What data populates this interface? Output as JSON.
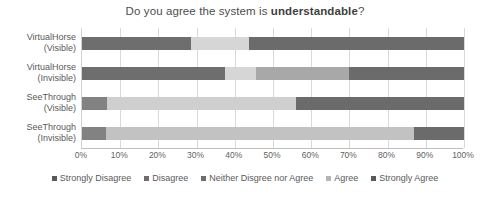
{
  "chart_data": {
    "type": "bar",
    "orientation": "horizontal",
    "stacked": true,
    "normalized": true,
    "title": "Do you agree the system is understandable?",
    "title_plain": "Do you agree the system is ",
    "title_bold": "understandable",
    "title_suffix": "?",
    "xlabel": "",
    "ylabel": "",
    "xlim": [
      0,
      100
    ],
    "xtick_labels": [
      "0%",
      "10%",
      "20%",
      "30%",
      "40%",
      "50%",
      "60%",
      "70%",
      "80%",
      "90%",
      "100%"
    ],
    "xtick_values": [
      0,
      10,
      20,
      30,
      40,
      50,
      60,
      70,
      80,
      90,
      100
    ],
    "grid": true,
    "legend_position": "bottom",
    "categories": [
      {
        "line1": "VirtualHorse",
        "line2": "(Visible)"
      },
      {
        "line1": "VirtualHorse",
        "line2": "(Invisible)"
      },
      {
        "line1": "SeeThrough",
        "line2": "(Visible)"
      },
      {
        "line1": "SeeThrough",
        "line2": "(Invisible)"
      }
    ],
    "series": [
      {
        "name": "Strongly Disagree",
        "color": "#808080",
        "values": [
          0,
          0,
          0,
          0
        ]
      },
      {
        "name": "Disagree",
        "color": "#6e6e6e",
        "values": [
          28.5,
          37.5,
          6.5,
          6.3
        ]
      },
      {
        "name": "Neither Disgree nor Agree",
        "color": "#d4d4d4",
        "values": [
          15.2,
          8.0,
          49.5,
          0
        ]
      },
      {
        "name": "Agree",
        "color": "#a6a6a6",
        "values": [
          0,
          24.5,
          0,
          80.7
        ]
      },
      {
        "name": "Strongly Agree",
        "color": "#666666",
        "values": [
          56.3,
          30.0,
          44.0,
          13.0
        ]
      }
    ],
    "bars": [
      {
        "category": "VirtualHorse (Visible)",
        "segments": [
          {
            "label": "Disagree",
            "value": 28.5,
            "color": "#6e6e6e"
          },
          {
            "label": "Neither Disgree nor Agree",
            "value": 15.2,
            "color": "#d6d6d6"
          },
          {
            "label": "Strongly Agree",
            "value": 56.3,
            "color": "#6b6b6b"
          }
        ]
      },
      {
        "category": "VirtualHorse (Invisible)",
        "segments": [
          {
            "label": "Disagree",
            "value": 37.5,
            "color": "#6e6e6e"
          },
          {
            "label": "Neither Disgree nor Agree",
            "value": 8.0,
            "color": "#d6d6d6"
          },
          {
            "label": "Agree",
            "value": 24.5,
            "color": "#a8a8a8"
          },
          {
            "label": "Strongly Agree",
            "value": 30.0,
            "color": "#6b6b6b"
          }
        ]
      },
      {
        "category": "SeeThrough (Visible)",
        "segments": [
          {
            "label": "Disagree",
            "value": 6.5,
            "color": "#828282"
          },
          {
            "label": "Neither Disgree nor Agree",
            "value": 49.5,
            "color": "#cfcfcf"
          },
          {
            "label": "Strongly Agree",
            "value": 44.0,
            "color": "#6b6b6b"
          }
        ]
      },
      {
        "category": "SeeThrough (Invisible)",
        "segments": [
          {
            "label": "Disagree",
            "value": 6.3,
            "color": "#828282"
          },
          {
            "label": "Agree",
            "value": 80.7,
            "color": "#c2c2c2"
          },
          {
            "label": "Strongly Agree",
            "value": 13.0,
            "color": "#6b6b6b"
          }
        ]
      }
    ],
    "legend": [
      {
        "label": "Strongly Disagree",
        "color": "#595959"
      },
      {
        "label": "Disagree",
        "color": "#6e6e6e"
      },
      {
        "label": "Neither Disgree nor Agree",
        "color": "#6e6e6e"
      },
      {
        "label": "Agree",
        "color": "#b5b5b5"
      },
      {
        "label": "Strongly Agree",
        "color": "#595959"
      }
    ]
  }
}
